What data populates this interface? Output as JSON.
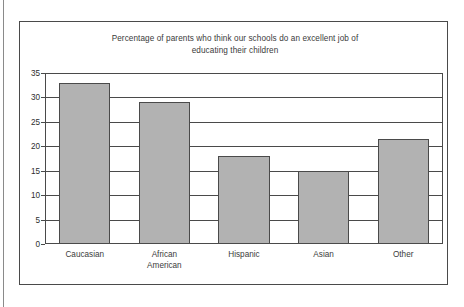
{
  "chart_data": {
    "type": "bar",
    "title": "Percentage of parents who think our schools do an excellent job of educating their children",
    "title_line1": "Percentage of parents who think our schools do an excellent job of",
    "title_line2": "educating their children",
    "categories": [
      "Caucasian",
      "African\nAmerican",
      "Hispanic",
      "Asian",
      "Other"
    ],
    "values": [
      33,
      29,
      18,
      15,
      21.5
    ],
    "xlabel": "",
    "ylabel": "",
    "ylim": [
      0,
      35
    ],
    "y_ticks": [
      0,
      5,
      10,
      15,
      20,
      25,
      30,
      35
    ],
    "y_tick_labels": [
      "0",
      "5",
      "10",
      "15",
      "20",
      "25",
      "30",
      "35"
    ],
    "grid": true,
    "legend": "none",
    "bar_color": "#b2b2b2",
    "bar_border_color": "#4a4a4a",
    "axis_color": "#4a4a4a",
    "text_color": "#3b3b3b",
    "background": "#ffffff"
  }
}
